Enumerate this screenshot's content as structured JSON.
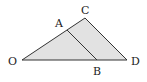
{
  "diagram": {
    "type": "geometry",
    "fill_color": "#e2e2e2",
    "stroke_color": "#333333",
    "points": {
      "O": {
        "label": "O",
        "x": 22,
        "y": 60
      },
      "C": {
        "label": "C",
        "x": 85,
        "y": 18
      },
      "D": {
        "label": "D",
        "x": 127,
        "y": 60
      },
      "A": {
        "label": "A",
        "x": 67,
        "y": 30
      },
      "B": {
        "label": "B",
        "x": 97,
        "y": 60
      }
    },
    "segments": [
      "OC",
      "CD",
      "OD",
      "AB"
    ],
    "shaded_region": "triangle OCD"
  }
}
